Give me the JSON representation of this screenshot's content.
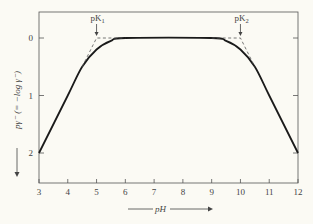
{
  "chart_data": {
    "type": "line",
    "title": "",
    "xlabel": "pH",
    "ylabel": "pγ⁻ (= −log γ⁻)",
    "xlim": [
      3,
      12
    ],
    "ylim": [
      2,
      0
    ],
    "y_inverted": true,
    "grid": false,
    "legend": null,
    "x_ticks": [
      "3",
      "4",
      "5",
      "6",
      "7",
      "8",
      "9",
      "10",
      "11",
      "12"
    ],
    "y_ticks": [
      "0",
      "1",
      "2"
    ],
    "series": [
      {
        "name": "pγ⁻ curve",
        "style": "solid",
        "x": [
          3,
          4,
          4.5,
          5,
          5.5,
          6,
          9,
          9.5,
          10,
          10.5,
          11,
          12
        ],
        "y": [
          2.0,
          1.0,
          0.5,
          0.2,
          0.05,
          0.0,
          0.0,
          0.05,
          0.2,
          0.5,
          1.0,
          2.0
        ]
      },
      {
        "name": "asymptote-left",
        "style": "dashed",
        "x": [
          4.5,
          5,
          6
        ],
        "y": [
          0.5,
          0.0,
          0.0
        ]
      },
      {
        "name": "asymptote-right",
        "style": "dashed",
        "x": [
          9,
          10,
          10.5
        ],
        "y": [
          0.0,
          0.0,
          0.5
        ]
      }
    ],
    "annotations": [
      {
        "text": "pK₁",
        "x": 5,
        "y": 0,
        "arrow": "down"
      },
      {
        "text": "pK₂",
        "x": 10,
        "y": 0,
        "arrow": "down"
      }
    ]
  },
  "labels": {
    "pk1_main": "pK",
    "pk1_sub": "1",
    "pk2_main": "pK",
    "pk2_sub": "2",
    "xaxis": "pH",
    "yaxis": "pγ⁻ (= −log γ⁻)"
  }
}
